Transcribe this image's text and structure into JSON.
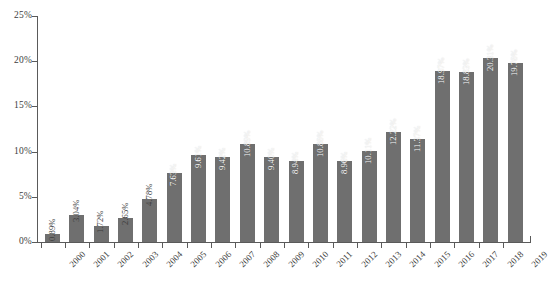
{
  "chart_data": {
    "type": "bar",
    "title": "",
    "subtitle": "",
    "xlabel": "",
    "ylabel": "",
    "ylim": [
      0,
      25
    ],
    "yunit": "%",
    "grid": false,
    "legend": null,
    "orientation": "vertical",
    "bar_color": "#6f6f6f",
    "axis_color": "#5a5a5a",
    "label_color": "#3d3d3d",
    "value_label_color": "#ffffff",
    "y_ticks": [
      "0%",
      "5%",
      "10%",
      "15%",
      "20%",
      "25%"
    ],
    "y_tick_values": [
      0,
      5,
      10,
      15,
      20,
      25
    ],
    "categories": [
      "2000",
      "2001",
      "2002",
      "2003",
      "2004",
      "2005",
      "2006",
      "2007",
      "2008",
      "2009",
      "2010",
      "2011",
      "2012",
      "2013",
      "2014",
      "2015",
      "2016",
      "2017",
      "2018",
      "2019"
    ],
    "values": [
      0.89,
      3.04,
      1.72,
      2.65,
      4.78,
      7.63,
      9.61,
      9.42,
      10.89,
      9.4,
      8.94,
      10.88,
      8.96,
      10.11,
      12.22,
      11.37,
      18.97,
      18.83,
      20.31,
      19.78
    ],
    "data_labels": [
      "0.89%",
      "3.04%",
      "1.72%",
      "2.65%",
      "4.78%",
      "7.63%",
      "9.61%",
      "9.42%",
      "10.89%",
      "9.40%",
      "8.94%",
      "10.88%",
      "8.96%",
      "10.11%",
      "12.22%",
      "11.37%",
      "18.97%",
      "18.83%",
      "20.31%",
      "19.78%"
    ]
  }
}
